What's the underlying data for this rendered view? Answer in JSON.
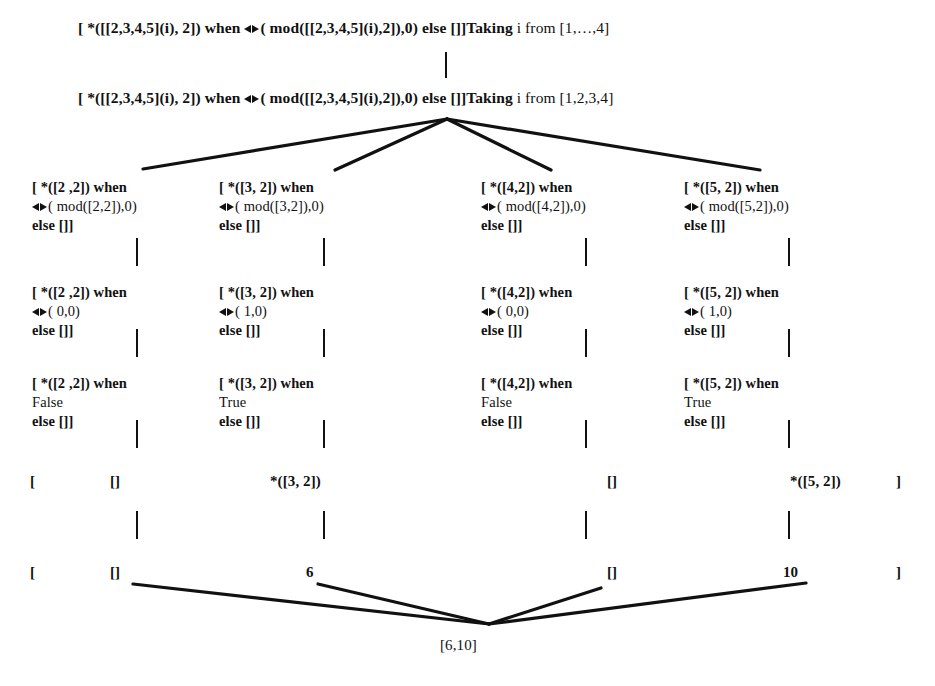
{
  "figure": {
    "caption": "",
    "colors": {
      "ink": "#111111",
      "background": "#ffffff"
    }
  },
  "rows": {
    "root_top": {
      "pre": "[ *([[2,3,4,5](i), 2]) when ",
      "op": "<>",
      "post": "( mod([[2,3,4,5](i),2]),0) else []]",
      "tail_bold": "Taking",
      "tail": " i from [1,…,4]"
    },
    "root_expanded": {
      "pre": "[ *([[2,3,4,5](i), 2]) when ",
      "op": "<>",
      "post": "( mod([[2,3,4,5](i),2]),0) else []]",
      "tail_bold": "Taking",
      "tail": " i from [1,2,3,4]"
    },
    "level_mod": [
      {
        "l1": "[ *([2 ,2]) when",
        "op": "<>",
        "l2": "( mod([2,2]),0)",
        "l3": "else []]"
      },
      {
        "l1": "[ *([3, 2]) when",
        "op": "<>",
        "l2": "( mod([3,2]),0)",
        "l3": "else []]"
      },
      {
        "l1": "[ *([4,2]) when",
        "op": "<>",
        "l2": "( mod([4,2]),0)",
        "l3": "else []]"
      },
      {
        "l1": "[ *([5, 2]) when",
        "op": "<>",
        "l2": "( mod([5,2]),0)",
        "l3": "else []]"
      }
    ],
    "level_cmp": [
      {
        "l1": "[ *([2 ,2]) when",
        "op": "<>",
        "l2": "( 0,0)",
        "l3": "else []]"
      },
      {
        "l1": "[ *([3, 2]) when",
        "op": "<>",
        "l2": "( 1,0)",
        "l3": "else []]"
      },
      {
        "l1": "[ *([4,2]) when",
        "op": "<>",
        "l2": "( 0,0)",
        "l3": "else []]"
      },
      {
        "l1": "[ *([5, 2]) when",
        "op": "<>",
        "l2": "( 1,0)",
        "l3": "else []]"
      }
    ],
    "level_bool": [
      {
        "l1": "[ *([2 ,2]) when",
        "l2": "False",
        "l3": "else []]"
      },
      {
        "l1": "[ *([3, 2]) when",
        "l2": "True",
        "l3": "else []]"
      },
      {
        "l1": "[ *([4,2]) when",
        "l2": "False",
        "l3": "else []]"
      },
      {
        "l1": "[ *([5, 2]) when",
        "l2": "True",
        "l3": "else []]"
      }
    ],
    "level_select": {
      "open_bracket": "[",
      "items": [
        "[]",
        "*([3, 2])",
        "[]",
        "*([5, 2])"
      ],
      "close_bracket": "]"
    },
    "level_values": {
      "open_bracket": "[",
      "items": [
        "[]",
        "6",
        "[]",
        "10"
      ],
      "close_bracket": "]"
    },
    "result": "[6,10]"
  }
}
